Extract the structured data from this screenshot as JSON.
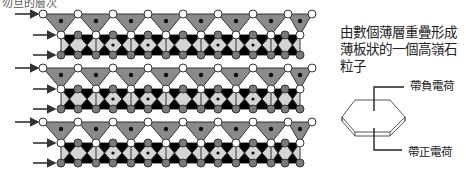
{
  "header": {
    "cut_title": "勿旦的層次"
  },
  "caption": {
    "lines": [
      "由數個薄層重疊形成",
      "薄板狀的一個高嶺石",
      "粒子"
    ]
  },
  "labels": {
    "negative_charge": "帶負電荷",
    "positive_charge": "帶正電荷"
  },
  "diagram": {
    "layer_count": 3,
    "layer_offsets_y": [
      0,
      54,
      108
    ],
    "tetra_apex_x": [
      43,
      78,
      113,
      148,
      183,
      218,
      253,
      288,
      312
    ],
    "colors": {
      "tetrahedron": "#8a8a8a",
      "octahedral_band": "#d4d4d4",
      "oxygen_white": "#ffffff",
      "hydroxyl_gray": "#7a7a7a",
      "cation_dot": "#111111",
      "stroke": "#333333"
    },
    "arrow_icons": [
      "arrow-right",
      "arrow-right",
      "arrow-right"
    ]
  }
}
